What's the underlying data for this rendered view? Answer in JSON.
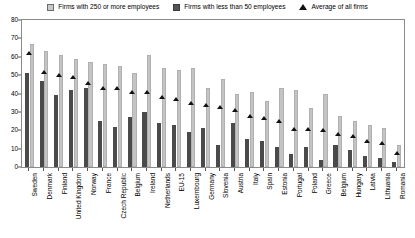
{
  "legend": {
    "position": "top-center",
    "items": [
      {
        "label": "Firms with 250 or more employees",
        "marker": "square-light-gray",
        "color": "#c4c4c4"
      },
      {
        "label": "Firms with less than 50 employees",
        "marker": "square-dark-gray",
        "color": "#4a4a4a"
      },
      {
        "label": "Average of all firms",
        "marker": "triangle-black",
        "color": "#111111"
      }
    ]
  },
  "chart_data": {
    "type": "bar",
    "title": "",
    "subtitle": "",
    "xlabel": "",
    "ylabel": "",
    "ylim": [
      0,
      80
    ],
    "yticks": [
      0,
      10,
      20,
      30,
      40,
      50,
      60,
      70,
      80
    ],
    "grid": false,
    "legend_position": "top-center",
    "categories": [
      "Sweden",
      "Denmark",
      "Finland",
      "United Kingdom",
      "Norway",
      "France",
      "Czech Republic",
      "Belgium",
      "Ireland",
      "Netherlands",
      "EU-15",
      "Luxembourg",
      "Germany",
      "Slovenia",
      "Austria",
      "Italy",
      "Spain",
      "Estonia",
      "Portugal",
      "Poland",
      "Greece",
      "Belgium",
      "Hungary",
      "Latvia",
      "Lithuania",
      "Romania"
    ],
    "series": [
      {
        "name": "Firms with less than 50 employees",
        "color": "#4a4a4a",
        "values": [
          51,
          47,
          39,
          42,
          43,
          25,
          22,
          27,
          30,
          24,
          23,
          19,
          21,
          12,
          24,
          15,
          14,
          11,
          7,
          11,
          4,
          12,
          9,
          6,
          5,
          3
        ]
      },
      {
        "name": "Firms with 250 or more employees",
        "color": "#c4c4c4",
        "values": [
          67,
          63,
          61,
          59,
          57,
          56,
          55,
          51,
          61,
          54,
          53,
          54,
          43,
          48,
          40,
          41,
          36,
          43,
          42,
          32,
          40,
          28,
          25,
          23,
          21,
          12
        ]
      }
    ],
    "markers": {
      "name": "Average of all firms",
      "color": "#111111",
      "values": [
        62,
        52,
        50,
        49,
        46,
        43,
        43,
        41,
        41,
        38,
        37,
        35,
        34,
        33,
        31,
        28,
        27,
        25,
        21,
        21,
        20,
        18,
        17,
        14,
        13,
        8
      ]
    }
  }
}
